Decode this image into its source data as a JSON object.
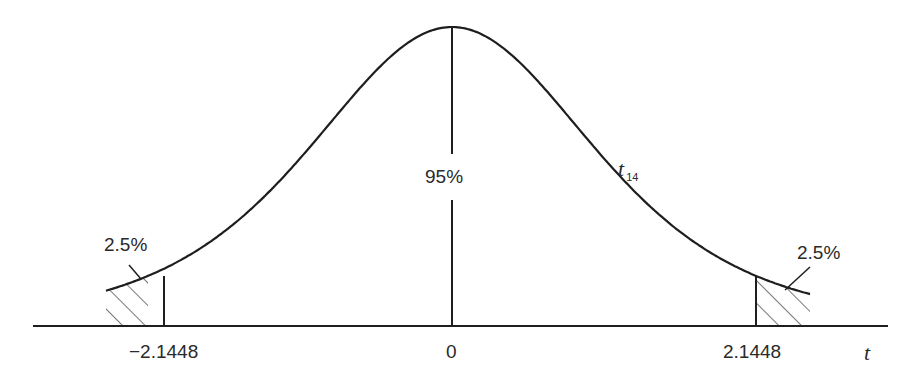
{
  "chart_data": {
    "type": "line",
    "title": "",
    "distribution": "t",
    "degrees_of_freedom": 14,
    "curve_label": "t",
    "curve_label_subscript": "14",
    "xlabel": "t",
    "ylabel": "",
    "x_ticks": [
      {
        "value": -2.1448,
        "label": "−2.1448"
      },
      {
        "value": 0,
        "label": "0"
      },
      {
        "value": 2.1448,
        "label": "2.1448"
      }
    ],
    "regions": [
      {
        "name": "left-tail",
        "from": null,
        "to": -2.1448,
        "area_percent": 2.5,
        "label": "2.5%",
        "shaded": true,
        "pattern": "hatched"
      },
      {
        "name": "center",
        "from": -2.1448,
        "to": 2.1448,
        "area_percent": 95,
        "label": "95%",
        "shaded": false
      },
      {
        "name": "right-tail",
        "from": 2.1448,
        "to": null,
        "area_percent": 2.5,
        "label": "2.5%",
        "shaded": true,
        "pattern": "hatched"
      }
    ],
    "critical_value": 2.1448,
    "grid": false,
    "legend": "none"
  },
  "labels": {
    "left_tail": "2.5%",
    "right_tail": "2.5%",
    "center": "95%",
    "curve_name": "t",
    "curve_sub": "14",
    "tick_left": "−2.1448",
    "tick_zero": "0",
    "tick_right": "2.1448",
    "axis_var": "t"
  },
  "colors": {
    "line": "#1e1e1e",
    "text": "#2a2a2a",
    "background": "#ffffff"
  }
}
